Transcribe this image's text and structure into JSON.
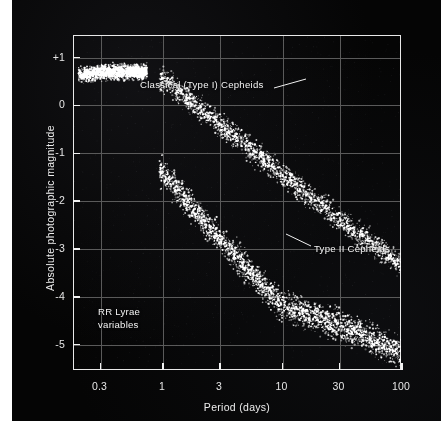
{
  "figure": {
    "background_color": "#050505",
    "frame_color": "#e8e8e8",
    "grid_color": "#5a5a5a",
    "point_color": "#ffffff"
  },
  "chart_data": {
    "type": "scatter",
    "title": "",
    "xlabel": "Period (days)",
    "ylabel": "Absolute photographic magnitude",
    "xscale": "log",
    "xlim": [
      0.18,
      100
    ],
    "ylim": [
      1.45,
      -5.55
    ],
    "grid": true,
    "legend": "none",
    "xticks": [
      0.3,
      1,
      3,
      10,
      30,
      100
    ],
    "xticklabels": [
      "0.3",
      "1",
      "3",
      "10",
      "30",
      "100"
    ],
    "yticks": [
      -5,
      -4,
      -3,
      -2,
      -1,
      0,
      1
    ],
    "yticklabels": [
      "-5",
      "-4",
      "-3",
      "-2",
      "-1",
      "0",
      "+1"
    ],
    "series": [
      {
        "name": "Classical (Type I) Cepheids",
        "n_points": 2400,
        "color": "#ffffff",
        "relation": "M = -1.43 - 2.81 * log10(P)",
        "period_range": [
          0.95,
          100
        ],
        "magnitude_range": [
          -1.3,
          -5.2
        ],
        "scatter_sigma": 0.26,
        "anchor_points": [
          {
            "period": 1,
            "magnitude": -1.4
          },
          {
            "period": 3,
            "magnitude": -2.8
          },
          {
            "period": 10,
            "magnitude": -4.2
          },
          {
            "period": 30,
            "magnitude": -4.6
          },
          {
            "period": 100,
            "magnitude": -5.2
          }
        ]
      },
      {
        "name": "Type II Cepheids",
        "n_points": 1900,
        "color": "#ffffff",
        "relation": "M = 0.58 - 2.00 * log10(P)",
        "period_range": [
          0.95,
          100
        ],
        "magnitude_range": [
          0.6,
          -3.4
        ],
        "scatter_sigma": 0.22,
        "anchor_points": [
          {
            "period": 1,
            "magnitude": 0.55
          },
          {
            "period": 3,
            "magnitude": -0.4
          },
          {
            "period": 10,
            "magnitude": -1.45
          },
          {
            "period": 30,
            "magnitude": -2.4
          },
          {
            "period": 100,
            "magnitude": -3.35
          }
        ]
      },
      {
        "name": "RR Lyrae variables",
        "n_points": 1500,
        "color": "#ffffff",
        "relation": "M ~ +0.65 (flat)",
        "period_range": [
          0.2,
          0.75
        ],
        "magnitude_range": [
          0.45,
          0.95
        ],
        "scatter_sigma": 0.13,
        "anchor_points": [
          {
            "period": 0.2,
            "magnitude": 0.62
          },
          {
            "period": 0.3,
            "magnitude": 0.66
          },
          {
            "period": 0.5,
            "magnitude": 0.68
          },
          {
            "period": 0.7,
            "magnitude": 0.68
          }
        ]
      }
    ],
    "annotations": [
      {
        "id": "classical-cepheids",
        "text": "Classical (Type I) Cepheids",
        "label_x_px": 128,
        "label_y_px": 79,
        "leader_from_px": [
          262,
          88
        ],
        "leader_to_px": [
          294,
          79
        ]
      },
      {
        "id": "type-ii-cepheids",
        "text": "Type II Cepheids",
        "label_x_px": 302,
        "label_y_px": 243,
        "leader_from_px": [
          299,
          246
        ],
        "leader_to_px": [
          274,
          234
        ]
      },
      {
        "id": "rr-lyrae",
        "text_line_1": "RR Lyrae",
        "text_line_2": "variables",
        "label_x_px": 86,
        "label_y_px": 306
      }
    ]
  }
}
